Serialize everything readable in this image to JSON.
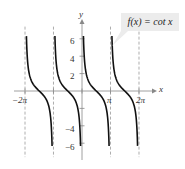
{
  "chart_data": {
    "type": "line",
    "title": "",
    "function_label": "f(x) = cot x",
    "xlabel": "x",
    "ylabel": "y",
    "x_tick_labels": [
      "−2π",
      "π",
      "2π"
    ],
    "x_ticks": [
      -6.283,
      -3.1416,
      0,
      3.1416,
      6.283
    ],
    "y_tick_labels": [
      "6",
      "4",
      "2",
      "−4",
      "−6"
    ],
    "y_ticks": [
      6,
      4,
      2,
      -2,
      -4,
      -6
    ],
    "asymptotes": [
      -6.283,
      -3.1416,
      0,
      3.1416,
      6.283
    ],
    "xlim": [
      -7.0,
      7.2
    ],
    "ylim": [
      -7.5,
      7.5
    ],
    "grid": false,
    "series": [
      {
        "name": "cot x",
        "branches": [
          [
            -6.283,
            -3.1416
          ],
          [
            -3.1416,
            0
          ],
          [
            0,
            3.1416
          ],
          [
            3.1416,
            6.283
          ]
        ]
      }
    ]
  }
}
